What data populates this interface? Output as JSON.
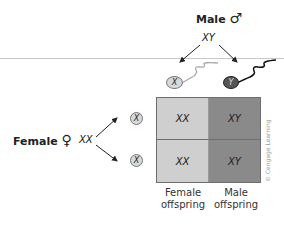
{
  "diagram": {
    "type": "punnett-square",
    "male": {
      "label": "Male",
      "symbol": "♂",
      "genotype": "XY"
    },
    "female": {
      "label": "Female",
      "symbol": "♀",
      "genotype": "XX"
    },
    "sperm": [
      {
        "allele": "X",
        "color": "#d8d8d8"
      },
      {
        "allele": "Y",
        "color": "#555555"
      }
    ],
    "eggs": [
      {
        "allele": "X"
      },
      {
        "allele": "X"
      }
    ],
    "grid": [
      [
        "XX",
        "XY"
      ],
      [
        "XX",
        "XY"
      ]
    ],
    "columns": [
      {
        "line1": "Female",
        "line2": "offspring",
        "color": "#cfcfcf"
      },
      {
        "line1": "Male",
        "line2": "offspring",
        "color": "#8a8a8a"
      }
    ],
    "credit": "© Cengage Learning"
  }
}
